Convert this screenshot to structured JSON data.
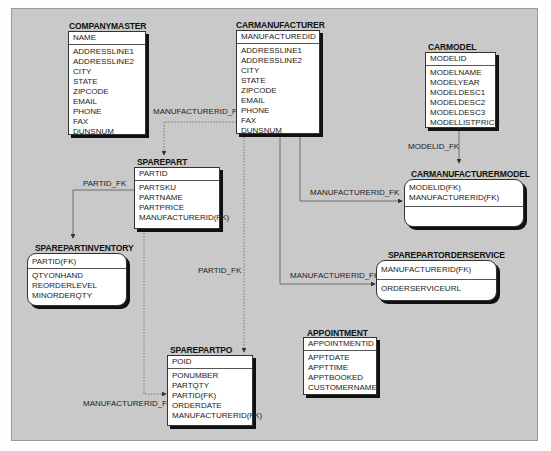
{
  "diagram": {
    "entities": {
      "companymaster": {
        "name": "COMPANYMASTER",
        "pk": [
          "NAME"
        ],
        "attrs": [
          "ADDRESSLINE1",
          "ADDRESSLINE2",
          "CITY",
          "STATE",
          "ZIPCODE",
          "EMAIL",
          "PHONE",
          "FAX",
          "DUNSNUM"
        ]
      },
      "carmanufacturer": {
        "name": "CARMANUFACTURER",
        "pk": [
          "MANUFACTUREDID"
        ],
        "attrs": [
          "ADDRESSLINE1",
          "ADDRESSLINE2",
          "CITY",
          "STATE",
          "ZIPCODE",
          "EMAIL",
          "PHONE",
          "FAX",
          "DUNSNUM"
        ]
      },
      "carmodel": {
        "name": "CARMODEL",
        "pk": [
          "MODELID"
        ],
        "attrs": [
          "MODELNAME",
          "MODELYEAR",
          "MODELDESC1",
          "MODELDESC2",
          "MODELDESC3",
          "MODELLISTPRICE"
        ]
      },
      "sparepart": {
        "name": "SPAREPART",
        "pk": [
          "PARTID"
        ],
        "attrs": [
          "PARTSKU",
          "PARTNAME",
          "PARTPRICE",
          "MANUFACTURERID(FK)"
        ]
      },
      "carmanufacturermodel": {
        "name": "CARMANUFACTURERMODEL",
        "pk": [
          "MODELID(FK)",
          "MANUFACTURERID(FK)"
        ],
        "attrs": []
      },
      "sparepartinventory": {
        "name": "SPAREPARTINVENTORY",
        "pk": [
          "PARTID(FK)"
        ],
        "attrs": [
          "QTYONHAND",
          "REORDERLEVEL",
          "MINORDERQTY"
        ]
      },
      "sparepartorderservice": {
        "name": "SPAREPARTORDERSERVICE",
        "pk": [
          "MANUFACTURERID(FK)"
        ],
        "attrs": [
          "ORDERSERVICEURL"
        ]
      },
      "appointment": {
        "name": "APPOINTMENT",
        "pk": [
          "APPOINTMENTID"
        ],
        "attrs": [
          "APPTDATE",
          "APPTTIME",
          "APPTBOOKED",
          "CUSTOMERNAME"
        ]
      },
      "sparepartpo": {
        "name": "SPAREPARTPO",
        "pk": [
          "POID"
        ],
        "attrs": [
          "PONUMBER",
          "PARTQTY",
          "PARTID(FK)",
          "ORDERDATE",
          "MANUFACTURERID(FK)"
        ]
      }
    },
    "relationships": [
      {
        "label": "MANUFACTURERID_FK",
        "from": "CARMANUFACTURER",
        "to": "SPAREPART",
        "style": "dashed"
      },
      {
        "label": "MODELID_FK",
        "from": "CARMODEL",
        "to": "CARMANUFACTURERMODEL",
        "style": "solid"
      },
      {
        "label": "PARTID_FK",
        "from": "SPAREPART",
        "to": "SPAREPARTINVENTORY",
        "style": "solid"
      },
      {
        "label": "MANUFACTURERID_FK",
        "from": "CARMANUFACTURER",
        "to": "CARMANUFACTURERMODEL",
        "style": "solid"
      },
      {
        "label": "MANUFACTURERID_FK",
        "from": "CARMANUFACTURER",
        "to": "SPAREPARTORDERSERVICE",
        "style": "solid"
      },
      {
        "label": "PARTID_FK",
        "from": "SPAREPART",
        "to": "SPAREPARTPO",
        "style": "dashed"
      },
      {
        "label": "MANUFACTURERID_FK",
        "from": "CARMANUFACTURER",
        "to": "SPAREPARTPO",
        "style": "dashed"
      }
    ],
    "colors": {
      "canvas": "#c9c9c9",
      "box": "#ffffff",
      "shadow": "#111111",
      "line": "#555555"
    }
  }
}
